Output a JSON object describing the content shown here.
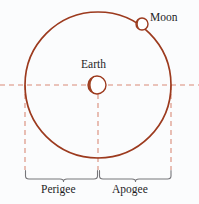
{
  "figure": {
    "width": 199,
    "height": 204,
    "background_color": "#fbfcfd"
  },
  "colors": {
    "orbit_stroke": "#9c3a1e",
    "body_outline": "#9c3a1e",
    "body_fill": "#ffffff",
    "crescent_fill": "#a04424",
    "dashed_line": "#d98a78",
    "bracket": "#76767a",
    "text": "#1d1d1f"
  },
  "labels": {
    "moon": "Moon",
    "earth": "Earth",
    "perigee": "Perigee",
    "apogee": "Apogee"
  },
  "geometry": {
    "orbit": {
      "cx": 98,
      "cy": 85,
      "r": 73
    },
    "earth": {
      "cx": 97,
      "cy": 85,
      "r": 9
    },
    "moon": {
      "cx": 142,
      "cy": 24,
      "r": 6
    },
    "axis_y": 85,
    "left_tick_x": 25,
    "center_tick_x": 98,
    "right_tick_x": 171,
    "bracket_y": 172,
    "vertical_drop_bottom": 170
  }
}
